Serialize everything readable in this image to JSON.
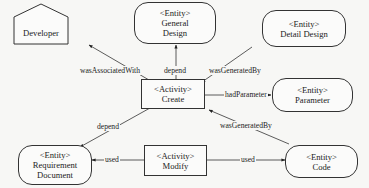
{
  "diagram": {
    "type": "PROV provenance graph",
    "nodes": [
      {
        "id": "developer",
        "kind": "agent",
        "lines": [
          "Developer"
        ]
      },
      {
        "id": "general_design",
        "kind": "entity",
        "lines": [
          "<Entity>",
          "General",
          "Design"
        ]
      },
      {
        "id": "detail_design",
        "kind": "entity",
        "lines": [
          "<Entity>",
          "Detail Design"
        ]
      },
      {
        "id": "create",
        "kind": "activity",
        "lines": [
          "<Activity>",
          "Create"
        ]
      },
      {
        "id": "parameter",
        "kind": "entity",
        "lines": [
          "<Entity>",
          "Parameter"
        ]
      },
      {
        "id": "requirement_document",
        "kind": "entity",
        "lines": [
          "<Entity>",
          "Requirement",
          "Document"
        ]
      },
      {
        "id": "modify",
        "kind": "activity",
        "lines": [
          "<Activity>",
          "Modify"
        ]
      },
      {
        "id": "code",
        "kind": "entity",
        "lines": [
          "<Entity>",
          "Code"
        ]
      }
    ],
    "edges": [
      {
        "from": "create",
        "to": "developer",
        "label": "wasAssociatedWith"
      },
      {
        "from": "create",
        "to": "general_design",
        "label": "depend"
      },
      {
        "from": "detail_design",
        "to": "create",
        "label": "wasGeneratedBy"
      },
      {
        "from": "create",
        "to": "parameter",
        "label": "hadParameter"
      },
      {
        "from": "create",
        "to": "requirement_document",
        "label": "depend"
      },
      {
        "from": "code",
        "to": "create",
        "label": "wasGeneratedBy"
      },
      {
        "from": "modify",
        "to": "requirement_document",
        "label": "used"
      },
      {
        "from": "modify",
        "to": "code",
        "label": "used"
      }
    ]
  },
  "labels": {
    "developer": "Developer",
    "entity_tag": "<Entity>",
    "activity_tag": "<Activity>",
    "general": "General",
    "design": "Design",
    "detail_design": "Detail Design",
    "create": "Create",
    "parameter": "Parameter",
    "requirement": "Requirement",
    "document": "Document",
    "modify": "Modify",
    "code": "Code",
    "was_associated_with": "wasAssociatedWith",
    "depend": "depend",
    "was_generated_by": "wasGeneratedBy",
    "had_parameter": "hadParameter",
    "used": "used"
  }
}
